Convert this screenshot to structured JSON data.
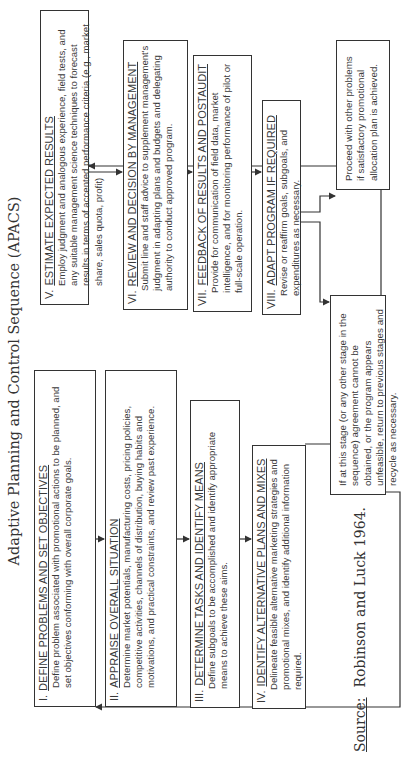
{
  "title": "Adaptive Planning and Control Sequence (APACS)",
  "steps": [
    {
      "num": "I.",
      "heading": "DEFINE PROBLEMS AND SET OBJECTIVES",
      "body": "Define problem associated with promotional actions to be planned, and set objectives conforming with overall corporate goals."
    },
    {
      "num": "II.",
      "heading": "APPRAISE OVERALL SITUATION",
      "body": "Determine market potentials, manufacturing costs, pricing policies, competitive activities, channels of distribution, buying habits and motivations, and practical constraints, and review past experience."
    },
    {
      "num": "III.",
      "heading": "DETERMINE TASKS AND IDENTIFY MEANS",
      "body": "Define subgoals to be accomplished and identify appropriate means to achieve these aims."
    },
    {
      "num": "IV.",
      "heading": "IDENTIFY ALTERNATIVE PLANS AND MIXES",
      "body": "Delineate feasible alternative marketing strategies and promotional mixes, and identify additional information required."
    },
    {
      "num": "V.",
      "heading": "ESTIMATE EXPECTED RESULTS",
      "body": "Employ judgment and analogous experience, field tests, and any suitable management science techniques to forecast results in terms of accented performance criteria (e.g., market share, sales quota, profit)"
    },
    {
      "num": "VI.",
      "heading": "REVIEW AND DECISION BY MANAGEMENT",
      "body": "Submit line and staff advice to supplement management's judgment in adapting plans and budgets and delegating authority to conduct approved program."
    },
    {
      "num": "VII.",
      "heading": "FEEDBACK OF RESULTS AND POSTAUDIT",
      "body": "Provide for communication of field data, market intelligence, and for monitoring performance of pilot or full-scale operation."
    },
    {
      "num": "VIII.",
      "heading": "ADAPT PROGRAM IF REQUIRED",
      "body": "Revise or reaffirm goals, subgoals, and expenditures as necessary."
    }
  ],
  "outcomes": {
    "proceed": "Proceed with other problems if satisfactory promotional allocation plan is achieved.",
    "recycle": "If at this stage (or any other stage in the sequence) agreement cannot be obtained, or the program appears unfeasible, return to previous stages and recycle as necessary."
  },
  "source": {
    "label": "Source:",
    "text": "Robinson and Luck 1964."
  }
}
